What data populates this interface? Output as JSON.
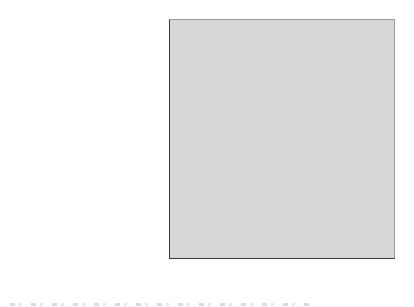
{
  "chart_data": {
    "type": "bar",
    "orientation": "horizontal",
    "xlabel": "(%)",
    "xlim": [
      0,
      20
    ],
    "xticks": [
      0,
      5,
      10,
      15,
      20
    ],
    "grid": "vertical-gridlines",
    "legend": "none",
    "categories": [
      "Visiting monuments",
      "Visiting countryside and nature",
      "Gastronomy",
      "Learning about art/history",
      "Relaxation",
      "Visitng cities and villages",
      "Visiting friends and relatives",
      "Festivals",
      "Camino de Santiago",
      "Sports activities",
      "Wine tourism",
      "Study",
      "Language learning",
      "Spas"
    ],
    "values": [
      19,
      14.2,
      11.8,
      11.4,
      11.1,
      9.8,
      8.6,
      5.3,
      2.6,
      2.5,
      1.3,
      0.6,
      0.5,
      0.3
    ]
  },
  "colors": {
    "page_bg": "#ffffff",
    "plot_bg": "#d7d7d7",
    "bar_fill": "#898989",
    "bar_border": "#4c4c4c",
    "gridline": "#808080",
    "axis": "#3a3a3a",
    "text": "#1c1c1c"
  }
}
